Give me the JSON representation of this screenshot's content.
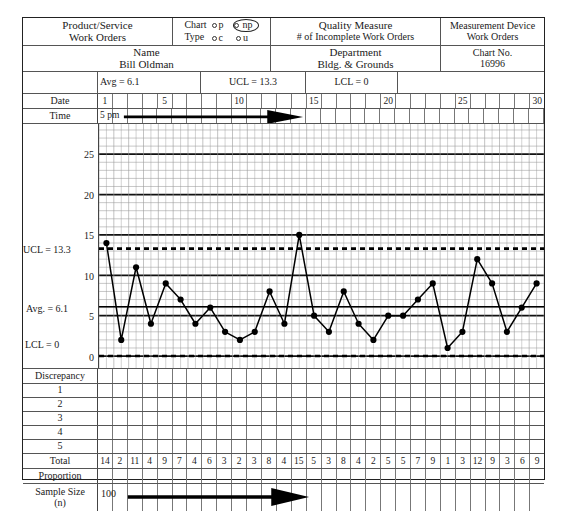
{
  "header": {
    "product_service": {
      "label": "Product/Service",
      "value": "Work Orders"
    },
    "chart_type": {
      "label_line1": "Chart",
      "label_line2": "Type",
      "options": [
        "p",
        "np",
        "c",
        "u"
      ],
      "selected": "np"
    },
    "quality_measure": {
      "label": "Quality Measure",
      "value": "# of Incomplete Work Orders"
    },
    "measurement_device": {
      "label": "Measurement Device",
      "value": "Work Orders"
    },
    "name": {
      "label": "Name",
      "value": "Bill Oldman"
    },
    "department": {
      "label": "Department",
      "value": "Bldg. & Grounds"
    },
    "stats": {
      "avg": "Avg = 6.1",
      "ucl": "UCL = 13.3",
      "lcl": "LCL = 0"
    },
    "chart_no": {
      "label": "Chart No.",
      "value": "16996"
    }
  },
  "axis_rows": {
    "date_label": "Date",
    "time_label": "Time",
    "time_value": "5 pm",
    "date_ticks": [
      "1",
      "",
      "",
      "",
      "5",
      "",
      "",
      "",
      "",
      "10",
      "",
      "",
      "",
      "",
      "15",
      "",
      "",
      "",
      "",
      "20",
      "",
      "",
      "",
      "",
      "25",
      "",
      "",
      "",
      "",
      "30"
    ]
  },
  "table": {
    "discrepancy_label": "Discrepancy",
    "discrepancy_rows": [
      "1",
      "2",
      "3",
      "4",
      "5"
    ],
    "total_label": "Total",
    "proportion_label": "Proportion",
    "sample_size_label_line1": "Sample  Size",
    "sample_size_label_line2": "(n)",
    "sample_size_value": "100"
  },
  "chart_data": {
    "type": "line",
    "chart_kind": "np control chart",
    "title": "# of Incomplete Work Orders",
    "xlabel": "Date",
    "ylabel": "",
    "ylim": [
      0,
      28
    ],
    "yticks": [
      0,
      5,
      10,
      15,
      20,
      25
    ],
    "ytick_labels": [
      "0",
      "5",
      "10",
      "15",
      "20",
      "25"
    ],
    "grid": true,
    "legend": "none",
    "x": [
      1,
      2,
      3,
      4,
      5,
      6,
      7,
      8,
      9,
      10,
      11,
      12,
      13,
      14,
      15,
      16,
      17,
      18,
      19,
      20,
      21,
      22,
      23,
      24,
      25,
      26,
      27,
      28,
      29,
      30
    ],
    "values": [
      14,
      2,
      11,
      4,
      9,
      7,
      4,
      6,
      3,
      2,
      3,
      8,
      4,
      15,
      5,
      3,
      8,
      4,
      2,
      5,
      5,
      7,
      9,
      1,
      3,
      12,
      9,
      3,
      6,
      9
    ],
    "center_line": {
      "label": "Avg. = 6.1",
      "value": 6.1,
      "style": "solid"
    },
    "upper_control_limit": {
      "label": "UCL = 13.3",
      "value": 13.3,
      "style": "dashed"
    },
    "lower_control_limit": {
      "label": "LCL = 0",
      "value": 0,
      "style": "dashed"
    }
  },
  "colors": {
    "ink": "#1a1a1a",
    "rule": "#555555",
    "grid_light": "#9a9a9a",
    "grid_bold": "#111111",
    "series": "#000000"
  }
}
